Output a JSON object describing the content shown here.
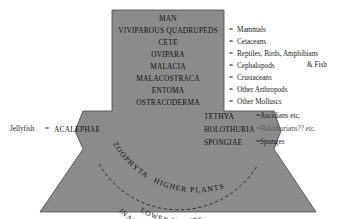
{
  "figure": {
    "colors": {
      "body_fill": "#8b8b8b",
      "body_stroke": "#4a4a4a",
      "background": "#ffffff",
      "text": "#131313",
      "dashed_arc": "#2a2a2a"
    }
  },
  "ladder": {
    "rungs": [
      {
        "name": "MAN",
        "gloss": ""
      },
      {
        "name": "VIVIPAROUS QUADRUPEDS",
        "gloss": "Mammals"
      },
      {
        "name": "CETE",
        "gloss": "Cetaceans"
      },
      {
        "name": "OVIPARA",
        "gloss": "Reptiles, Birds, Amphibians"
      },
      {
        "name": "MALACIA",
        "gloss": "Cephalopods"
      },
      {
        "name": "MALACOSTRACA",
        "gloss": "Crustaceans"
      },
      {
        "name": "ENTOMA",
        "gloss": "Other Arthropods"
      },
      {
        "name": "OSTRACODERMA",
        "gloss": "Other Molluscs"
      }
    ],
    "ovipara_continuation": "& Fish",
    "equals_sign": "="
  },
  "middle_band": {
    "left_gloss": "Jellyfish",
    "left_equals": "=",
    "left_name": "ACALEPHAE",
    "rows": [
      {
        "name": "TETHYA",
        "gloss": "Ascidians etc."
      },
      {
        "name": "HOLOTHURIA",
        "gloss": "Holothurians?? etc."
      },
      {
        "name": "SPONGIAE",
        "gloss": "Sponges"
      }
    ]
  },
  "curved_labels": {
    "zoophyta": "ZOOPHYTA",
    "higher_plants": "HIGHER PLANTS",
    "lower_plants": "LOWER PLANTS",
    "inanimate_matter": "INANIMATE MATTER"
  }
}
